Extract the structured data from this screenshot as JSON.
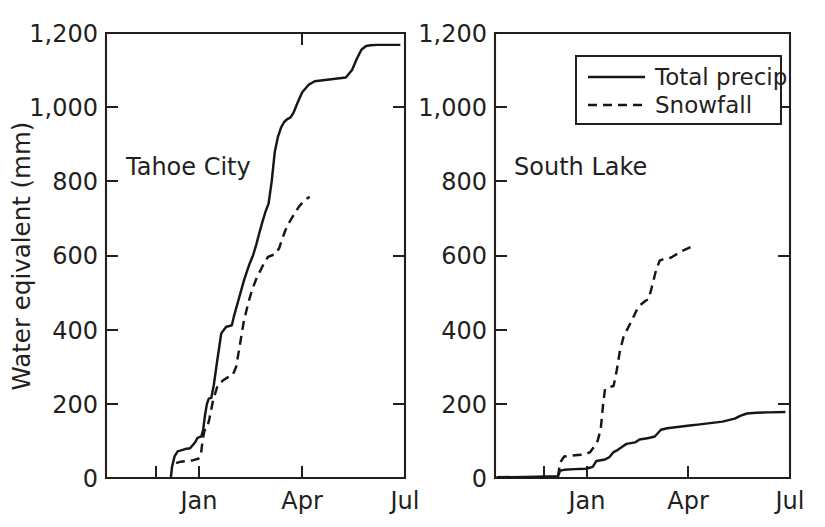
{
  "figure": {
    "background": "#ffffff",
    "ink_color": "#231f20",
    "width": 825,
    "height": 527
  },
  "axis": {
    "ylabel": "Water eqivalent (mm)",
    "y_ticks": [
      "0",
      "200",
      "400",
      "600",
      "800",
      "1,000",
      "1,200"
    ],
    "y_tick_values": [
      0,
      200,
      400,
      600,
      800,
      1000,
      1200
    ],
    "ylim": [
      0,
      1200
    ],
    "x_ticks": [
      "Jan",
      "Apr",
      "Jul"
    ],
    "x_tick_values": [
      3.0,
      6.0,
      9.0
    ],
    "xlim": [
      0,
      9.6
    ],
    "grid": "off"
  },
  "legend": {
    "position": "top-right of right panel",
    "entries": [
      {
        "label": "Total precip",
        "style": "solid"
      },
      {
        "label": "Snowfall",
        "style": "dashed"
      }
    ]
  },
  "chart_data": [
    {
      "type": "line",
      "title": "Tahoe City",
      "panel": "left",
      "xlabel": "",
      "ylabel": "Water eqivalent (mm)",
      "ylim": [
        0,
        1200
      ],
      "xlim": [
        0,
        9.6
      ],
      "x_tick_labels": [
        "Jan",
        "Apr",
        "Jul"
      ],
      "y_tick_labels": [
        "0",
        "200",
        "400",
        "600",
        "800",
        "1,000",
        "1,200"
      ],
      "grid": "off",
      "series": [
        {
          "name": "Total precip",
          "style": "solid",
          "x": [
            2.08,
            2.12,
            2.2,
            2.3,
            2.38,
            2.46,
            2.54,
            2.7,
            2.86,
            2.94,
            3.0,
            3.06,
            3.12,
            3.18,
            3.24,
            3.3,
            3.38,
            3.46,
            3.56,
            3.7,
            3.86,
            3.96,
            4.04,
            4.12,
            4.22,
            4.32,
            4.42,
            4.52,
            4.62,
            4.72,
            4.82,
            4.92,
            5.02,
            5.12,
            5.22,
            5.32,
            5.42,
            5.52,
            5.62,
            5.72,
            5.82,
            5.92,
            6.02,
            6.14,
            6.3,
            6.5,
            6.7,
            6.9,
            7.1,
            7.3,
            7.5,
            7.7,
            7.9,
            8.05,
            8.2,
            8.35,
            8.5,
            8.7,
            9.0,
            9.45
          ],
          "y": [
            0,
            30,
            58,
            72,
            74,
            76,
            78,
            80,
            96,
            108,
            110,
            112,
            130,
            170,
            200,
            214,
            216,
            250,
            310,
            390,
            408,
            410,
            412,
            440,
            470,
            500,
            530,
            556,
            580,
            600,
            628,
            660,
            690,
            718,
            740,
            800,
            880,
            920,
            945,
            960,
            968,
            972,
            985,
            1010,
            1040,
            1060,
            1070,
            1072,
            1074,
            1076,
            1078,
            1080,
            1100,
            1130,
            1155,
            1165,
            1167,
            1168,
            1168,
            1168
          ]
        },
        {
          "name": "Snowfall",
          "style": "dashed",
          "x": [
            2.25,
            2.4,
            2.6,
            2.8,
            2.96,
            3.04,
            3.1,
            3.16,
            3.24,
            3.32,
            3.44,
            3.58,
            3.74,
            3.92,
            4.06,
            4.18,
            4.3,
            4.42,
            4.56,
            4.7,
            4.84,
            4.96,
            5.08,
            5.2,
            5.32,
            5.44,
            5.56,
            5.66,
            5.76,
            5.86,
            5.96,
            6.06,
            6.18,
            6.3,
            6.42,
            6.54
          ],
          "y": [
            40,
            44,
            46,
            48,
            52,
            58,
            100,
            128,
            132,
            160,
            210,
            248,
            262,
            272,
            276,
            300,
            360,
            420,
            470,
            510,
            540,
            560,
            580,
            596,
            600,
            604,
            620,
            645,
            668,
            686,
            700,
            714,
            730,
            742,
            752,
            758
          ]
        }
      ]
    },
    {
      "type": "line",
      "title": "South Lake",
      "panel": "right",
      "xlabel": "",
      "ylabel": "",
      "ylim": [
        0,
        1200
      ],
      "xlim": [
        0,
        9.6
      ],
      "x_tick_labels": [
        "Jan",
        "Apr",
        "Jul"
      ],
      "y_tick_labels": [
        "0",
        "200",
        "400",
        "600",
        "800",
        "1,000",
        "1,200"
      ],
      "grid": "off",
      "series": [
        {
          "name": "Total precip",
          "style": "solid",
          "x": [
            0.05,
            1.0,
            1.7,
            2.05,
            2.12,
            2.25,
            2.6,
            2.95,
            3.05,
            3.18,
            3.3,
            3.44,
            3.58,
            3.72,
            3.86,
            4.0,
            4.14,
            4.28,
            4.42,
            4.56,
            4.7,
            4.86,
            5.0,
            5.2,
            5.4,
            5.6,
            5.8,
            6.0,
            6.2,
            6.4,
            6.6,
            6.8,
            7.0,
            7.2,
            7.4,
            7.6,
            7.8,
            8.0,
            8.2,
            8.5,
            8.9,
            9.45
          ],
          "y": [
            2,
            3,
            4,
            5,
            20,
            22,
            24,
            25,
            27,
            30,
            46,
            48,
            50,
            56,
            70,
            76,
            84,
            92,
            94,
            96,
            104,
            106,
            108,
            112,
            130,
            134,
            136,
            138,
            140,
            142,
            144,
            146,
            148,
            150,
            152,
            156,
            160,
            168,
            174,
            176,
            177,
            178
          ]
        },
        {
          "name": "Snowfall",
          "style": "dashed",
          "x": [
            2.05,
            2.12,
            2.25,
            2.45,
            2.7,
            2.95,
            3.1,
            3.22,
            3.34,
            3.44,
            3.52,
            3.58,
            3.66,
            3.76,
            3.86,
            3.96,
            4.06,
            4.18,
            4.3,
            4.42,
            4.54,
            4.66,
            4.78,
            4.9,
            5.0,
            5.12,
            5.24,
            5.36,
            5.48,
            5.6,
            5.72,
            5.84,
            5.96,
            6.08,
            6.24,
            6.4,
            6.52
          ],
          "y": [
            4,
            42,
            58,
            60,
            62,
            64,
            70,
            84,
            100,
            132,
            200,
            240,
            244,
            246,
            248,
            290,
            340,
            380,
            400,
            420,
            440,
            462,
            470,
            478,
            482,
            520,
            560,
            586,
            590,
            592,
            594,
            600,
            606,
            612,
            618,
            624,
            628
          ]
        }
      ]
    }
  ]
}
